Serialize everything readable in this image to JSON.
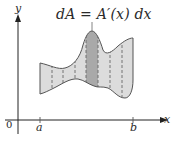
{
  "figure": {
    "formula": "dA = A′(x) dx",
    "axes": {
      "y_label": "y",
      "x_label": "x",
      "origin_label": "0"
    },
    "ticks": {
      "a_label": "a",
      "b_label": "b"
    },
    "region": {
      "description": "Irregular region between two curves from x=a to x=b, divided into vertical strips by dashed lines, with one highlighted strip of area dA",
      "strip_count": 7,
      "highlighted_strip_index": 3
    },
    "colors": {
      "region_fill": "#dcdcdc",
      "strip_fill": "#a9a9a9",
      "outline": "#555555",
      "dashed": "#666666",
      "axis": "#222222"
    }
  }
}
